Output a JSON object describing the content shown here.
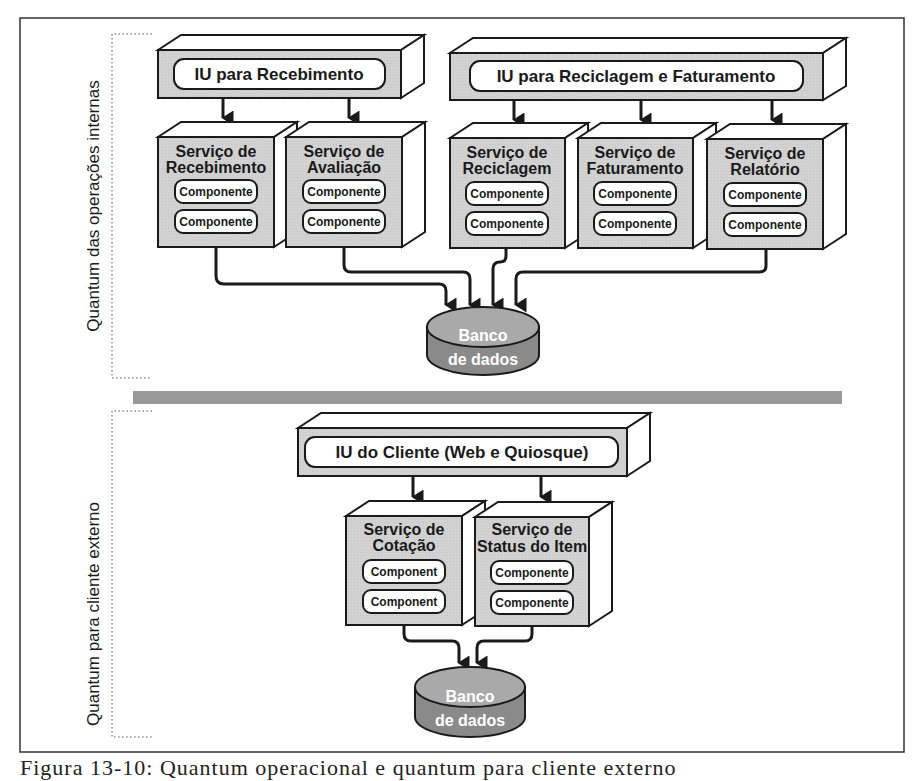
{
  "figure": {
    "caption_partial": "Figura 13-10: Quantum operacional e quantum para cliente externo",
    "colors": {
      "box_front": "#d4d4d4",
      "box_side": "#ffffff",
      "outline": "#1a1a1a",
      "db_top": "#a9a9a9",
      "db_body": "#8a8a8a",
      "divider": "#9a9a9a",
      "pill_fill": "#ffffff"
    }
  },
  "quanta": [
    {
      "label": "Quantum das operações internas",
      "ui_boxes": [
        {
          "label": "IU para Recebimento"
        },
        {
          "label": "IU para Reciclagem e Faturamento"
        }
      ],
      "services": [
        {
          "line1": "Serviço de",
          "line2": "Recebimento",
          "components": [
            "Componente",
            "Componente"
          ]
        },
        {
          "line1": "Serviço de",
          "line2": "Avaliação",
          "components": [
            "Componente",
            "Componente"
          ]
        },
        {
          "line1": "Serviço de",
          "line2": "Reciclagem",
          "components": [
            "Componente",
            "Componente"
          ]
        },
        {
          "line1": "Serviço de",
          "line2": "Faturamento",
          "components": [
            "Componente",
            "Componente"
          ]
        },
        {
          "line1": "Serviço de",
          "line2": "Relatório",
          "components": [
            "Componente",
            "Componente"
          ]
        }
      ],
      "database": {
        "line1": "Banco",
        "line2": "de dados"
      }
    },
    {
      "label": "Quantum para cliente externo",
      "ui_boxes": [
        {
          "label": "IU do Cliente (Web e Quiosque)"
        }
      ],
      "services": [
        {
          "line1": "Serviço de",
          "line2": "Cotação",
          "components": [
            "Component",
            "Component"
          ]
        },
        {
          "line1": "Serviço de",
          "line2": "Status do Item",
          "components": [
            "Componente",
            "Componente"
          ]
        }
      ],
      "database": {
        "line1": "Banco",
        "line2": "de dados"
      }
    }
  ]
}
